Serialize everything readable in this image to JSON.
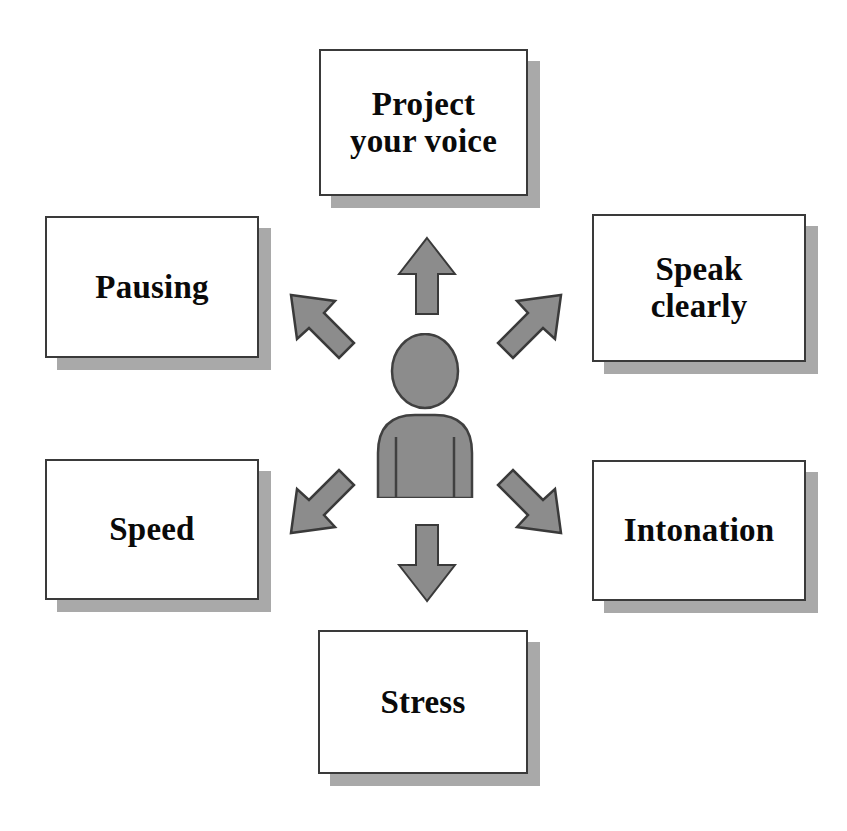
{
  "diagram": {
    "center": {
      "icon": "person-icon",
      "label": "",
      "fill_color": "#8c8c8c",
      "outline_color": "#404040"
    },
    "arrow_color": "#8c8c8c",
    "arrow_outline_color": "#3a3a3a",
    "box_fill": "#ffffff",
    "box_border": "#3a3a3a",
    "box_shadow_color": "#a9a9a9",
    "text_color": "#0a0a0a",
    "nodes": [
      {
        "id": "project-your-voice",
        "label": "Project\nyour voice",
        "position": "top",
        "arrow": "arrow-up-icon"
      },
      {
        "id": "pausing",
        "label": "Pausing",
        "position": "left-top",
        "arrow": "arrow-up-left-icon"
      },
      {
        "id": "speak-clearly",
        "label": "Speak\nclearly",
        "position": "right-top",
        "arrow": "arrow-up-right-icon"
      },
      {
        "id": "speed",
        "label": "Speed",
        "position": "left-bottom",
        "arrow": "arrow-down-left-icon"
      },
      {
        "id": "intonation",
        "label": "Intonation",
        "position": "right-bottom",
        "arrow": "arrow-down-right-icon"
      },
      {
        "id": "stress",
        "label": "Stress",
        "position": "bottom",
        "arrow": "arrow-down-icon"
      }
    ]
  }
}
